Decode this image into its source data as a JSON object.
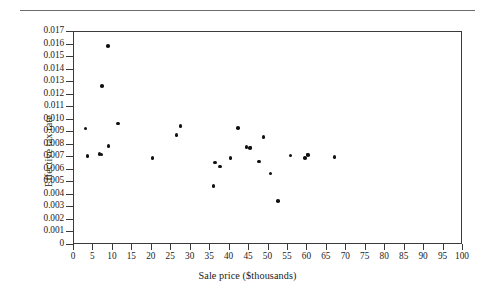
{
  "figure": {
    "has_top_rule": true,
    "background_color": "#ffffff",
    "point_color": "#111111",
    "axis_color": "#3a3a3a"
  },
  "chart_data": {
    "type": "scatter",
    "title": "",
    "xlabel": "Sale price ($thousands)",
    "ylabel": "Effective tax rate",
    "xlim": [
      0,
      100
    ],
    "ylim": [
      0,
      0.017
    ],
    "grid": false,
    "legend": null,
    "xticks": [
      0,
      5,
      10,
      15,
      20,
      25,
      30,
      35,
      40,
      45,
      50,
      55,
      60,
      65,
      70,
      75,
      80,
      85,
      90,
      95,
      100
    ],
    "xticklabels": [
      "0",
      "5",
      "10",
      "15",
      "20",
      "25",
      "30",
      "35",
      "40",
      "45",
      "50",
      "55",
      "60",
      "65",
      "70",
      "75",
      "80",
      "85",
      "90",
      "95",
      "100"
    ],
    "yticks": [
      0,
      0.001,
      0.002,
      0.003,
      0.004,
      0.005,
      0.006,
      0.007,
      0.008,
      0.009,
      0.01,
      0.011,
      0.012,
      0.013,
      0.014,
      0.015,
      0.016,
      0.017
    ],
    "yticklabels": [
      "0",
      "0.001",
      "0.002",
      "0.003",
      "0.004",
      "0.005",
      "0.006",
      "0.007",
      "0.008",
      "0.009",
      "0.010",
      "0.011",
      "0.012",
      "0.013",
      "0.014",
      "0.015",
      "0.016",
      "0.017"
    ],
    "x": [
      3.0,
      3.5,
      6.6,
      7.1,
      8.7,
      8.9,
      11.3,
      20.2,
      26.3,
      27.4,
      35.9,
      36.2,
      37.5,
      40.2,
      42.2,
      44.3,
      45.2,
      45.4,
      47.6,
      48.7,
      50.5,
      52.5,
      55.7,
      59.4,
      60.0,
      60.2,
      67.0
    ],
    "y": [
      0.0093,
      0.0071,
      0.00725,
      0.00722,
      0.0159,
      0.0079,
      0.0097,
      0.00695,
      0.0088,
      0.00952,
      0.0047,
      0.0066,
      0.00625,
      0.00693,
      0.00932,
      0.00783,
      0.00775,
      0.00778,
      0.00668,
      0.00862,
      0.00572,
      0.0035,
      0.00713,
      0.00692,
      0.00723,
      0.00718,
      0.00703
    ],
    "extra_point": {
      "x": 7.2,
      "y": 0.01268
    },
    "n_points": 28
  }
}
